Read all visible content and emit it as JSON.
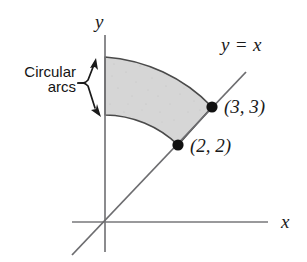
{
  "figure": {
    "type": "math-diagram",
    "axes": {
      "x_label": "x",
      "y_label": "y",
      "origin_px": [
        105,
        222
      ]
    },
    "line": {
      "label": "y = x",
      "slope": 1,
      "intercept": 0
    },
    "points": [
      {
        "id": "inner",
        "label": "(2, 2)",
        "x": 2,
        "y": 2
      },
      {
        "id": "outer",
        "label": "(3, 3)",
        "x": 3,
        "y": 3
      }
    ],
    "annotation": {
      "line1": "Circular",
      "line2": "arcs",
      "arrows": 2
    },
    "region": {
      "inner_radius": 2.828,
      "outer_radius": 4.243,
      "angle_from_deg": 45,
      "angle_to_deg": 90,
      "fill_color": "#d6d6d6",
      "stroke_color": "#4a4a4a"
    },
    "colors": {
      "axis": "#77777a",
      "line": "#6d6d70",
      "ink": "#1a1a1a",
      "dot": "#111111",
      "background": "#ffffff"
    }
  }
}
